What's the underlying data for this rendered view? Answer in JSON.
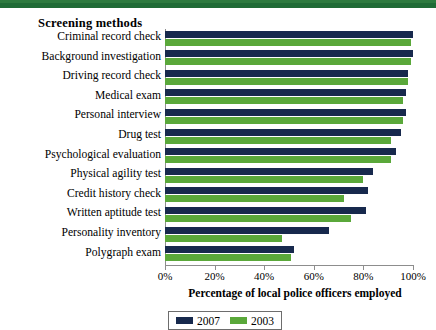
{
  "header": {
    "band_color": "#1f6b36"
  },
  "chart_header": {
    "methods_title": "Screening methods"
  },
  "axis": {
    "xlabel": "Percentage of local police officers employed",
    "tick_labels": [
      "0%",
      "20%",
      "40%",
      "60%",
      "80%",
      "100%"
    ]
  },
  "legend": {
    "items": [
      {
        "label": "2007",
        "color": "#17294d"
      },
      {
        "label": "2003",
        "color": "#5aa83a"
      }
    ]
  },
  "chart_data": {
    "type": "bar",
    "orientation": "horizontal",
    "title": "Screening methods",
    "xlabel": "Percentage of local police officers employed",
    "ylabel": "Screening methods",
    "xlim": [
      0,
      100
    ],
    "xticks": [
      0,
      20,
      40,
      60,
      80,
      100
    ],
    "xtick_labels": [
      "0%",
      "20%",
      "40%",
      "60%",
      "80%",
      "100%"
    ],
    "grid": false,
    "legend_position": "bottom",
    "categories": [
      "Criminal record check",
      "Background investigation",
      "Driving record check",
      "Medical exam",
      "Personal interview",
      "Drug test",
      "Psychological evaluation",
      "Physical agility test",
      "Credit history check",
      "Written aptitude test",
      "Personality inventory",
      "Polygraph exam"
    ],
    "series": [
      {
        "name": "2007",
        "color": "#17294d",
        "values": [
          100,
          100,
          98,
          97,
          97,
          95,
          93,
          84,
          82,
          81,
          66,
          52
        ]
      },
      {
        "name": "2003",
        "color": "#5aa83a",
        "values": [
          99,
          99,
          98,
          96,
          96,
          91,
          91,
          80,
          72,
          75,
          47,
          51
        ]
      }
    ]
  }
}
